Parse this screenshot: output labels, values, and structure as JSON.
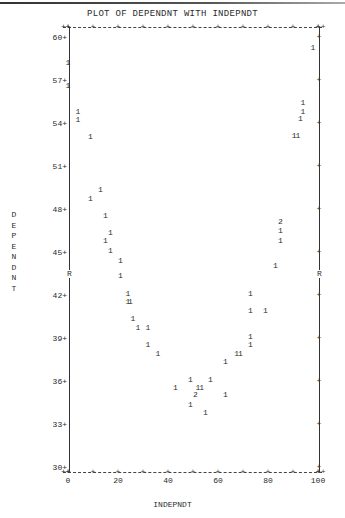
{
  "chart_data": {
    "type": "scatter",
    "title": "PLOT OF DEPENDNT WITH INDEPNDT",
    "xlabel": "INDEPNDT",
    "ylabel": "DEPENDNT",
    "xlim": [
      0,
      100
    ],
    "ylim": [
      30,
      60
    ],
    "x_ticks": [
      "0",
      "20",
      "40",
      "60",
      "80",
      "100"
    ],
    "y_ticks": [
      "60",
      "57",
      "54",
      "51",
      "48",
      "45",
      "42",
      "39",
      "36",
      "33",
      "30"
    ],
    "grid": false,
    "legend": "none; symbols show count of cases at each position",
    "reference_marker": {
      "symbol": "R",
      "y": 43.5
    },
    "points": [
      {
        "x": 0,
        "y": 58.2,
        "count": 1
      },
      {
        "x": 0,
        "y": 56.6,
        "count": 1
      },
      {
        "x": 4,
        "y": 54.8,
        "count": 1
      },
      {
        "x": 4,
        "y": 54.2,
        "count": 1
      },
      {
        "x": 9,
        "y": 53.0,
        "count": 1
      },
      {
        "x": 13,
        "y": 49.3,
        "count": 1
      },
      {
        "x": 9,
        "y": 48.7,
        "count": 1
      },
      {
        "x": 15,
        "y": 47.5,
        "count": 1
      },
      {
        "x": 17,
        "y": 46.3,
        "count": 1
      },
      {
        "x": 15,
        "y": 45.8,
        "count": 1
      },
      {
        "x": 17,
        "y": 45.1,
        "count": 1
      },
      {
        "x": 21,
        "y": 44.4,
        "count": 1
      },
      {
        "x": 21,
        "y": 43.3,
        "count": 1
      },
      {
        "x": 24,
        "y": 42.1,
        "count": 1
      },
      {
        "x": 24,
        "y": 41.5,
        "count": 1
      },
      {
        "x": 25,
        "y": 41.5,
        "count": 1
      },
      {
        "x": 26,
        "y": 40.3,
        "count": 1
      },
      {
        "x": 28,
        "y": 39.7,
        "count": 1
      },
      {
        "x": 32,
        "y": 39.7,
        "count": 1
      },
      {
        "x": 32,
        "y": 38.5,
        "count": 1
      },
      {
        "x": 36,
        "y": 37.9,
        "count": 1
      },
      {
        "x": 43,
        "y": 35.5,
        "count": 1
      },
      {
        "x": 49,
        "y": 36.1,
        "count": 1
      },
      {
        "x": 52,
        "y": 35.5,
        "count": 1
      },
      {
        "x": 53.5,
        "y": 35.5,
        "count": 1
      },
      {
        "x": 57,
        "y": 36.1,
        "count": 1
      },
      {
        "x": 51,
        "y": 35.0,
        "count": 2
      },
      {
        "x": 49,
        "y": 34.3,
        "count": 1
      },
      {
        "x": 55,
        "y": 33.8,
        "count": 1
      },
      {
        "x": 63,
        "y": 35.0,
        "count": 1
      },
      {
        "x": 63,
        "y": 37.3,
        "count": 1
      },
      {
        "x": 67.5,
        "y": 37.9,
        "count": 1
      },
      {
        "x": 69,
        "y": 37.9,
        "count": 1
      },
      {
        "x": 73,
        "y": 38.5,
        "count": 1
      },
      {
        "x": 73,
        "y": 39.1,
        "count": 1
      },
      {
        "x": 73,
        "y": 40.9,
        "count": 1
      },
      {
        "x": 79,
        "y": 40.9,
        "count": 1
      },
      {
        "x": 73,
        "y": 42.1,
        "count": 1
      },
      {
        "x": 83,
        "y": 44.0,
        "count": 1
      },
      {
        "x": 85,
        "y": 47.1,
        "count": 2
      },
      {
        "x": 85,
        "y": 46.5,
        "count": 1
      },
      {
        "x": 85,
        "y": 45.8,
        "count": 1
      },
      {
        "x": 90.5,
        "y": 53.1,
        "count": 1
      },
      {
        "x": 92,
        "y": 53.1,
        "count": 1
      },
      {
        "x": 93,
        "y": 54.3,
        "count": 1
      },
      {
        "x": 94,
        "y": 55.4,
        "count": 1
      },
      {
        "x": 94,
        "y": 54.8,
        "count": 1
      },
      {
        "x": 98,
        "y": 59.2,
        "count": 1
      }
    ]
  },
  "labels": {
    "title": "PLOT OF DEPENDNT WITH INDEPNDT",
    "xtitle": "INDEPNDT",
    "ytitle_letters": [
      "D",
      "E",
      "P",
      "E",
      "N",
      "D",
      "N",
      "T"
    ],
    "r_marker": "R"
  }
}
